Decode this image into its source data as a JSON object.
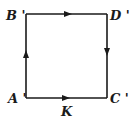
{
  "diagram": {
    "vertices": [
      {
        "id": "B",
        "label": "B '",
        "x": 26,
        "y": 14
      },
      {
        "id": "D",
        "label": "D '",
        "x": 107,
        "y": 14
      },
      {
        "id": "C",
        "label": "C '",
        "x": 107,
        "y": 98
      },
      {
        "id": "A",
        "label": "A '",
        "x": 26,
        "y": 98
      }
    ],
    "edges": [
      {
        "from": "A",
        "to": "B",
        "direction": "up"
      },
      {
        "from": "B",
        "to": "D",
        "direction": "right"
      },
      {
        "from": "D",
        "to": "C",
        "direction": "down"
      },
      {
        "from": "A",
        "to": "C",
        "direction": "right",
        "label": "K"
      }
    ],
    "labels": {
      "B": "B '",
      "D": "D '",
      "A": "A '",
      "C": "C '",
      "K": "K"
    },
    "line_color": "#1a1a1a"
  }
}
